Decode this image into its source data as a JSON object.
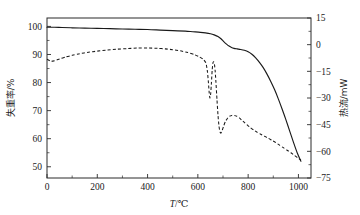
{
  "chart_data": {
    "type": "line",
    "title": "",
    "xlabel": "T/℃",
    "ylabel": "失重率/%",
    "y2label": "热流/mW",
    "xlim": [
      0,
      1050
    ],
    "ylim": [
      46,
      103
    ],
    "y2lim": [
      -75,
      15
    ],
    "grid": false,
    "legend": "none",
    "xticks": [
      0,
      200,
      400,
      600,
      800,
      1000
    ],
    "xticklabels": [
      "0",
      "200",
      "400",
      "600",
      "800",
      "1000"
    ],
    "yticks": [
      50,
      60,
      70,
      80,
      90,
      100
    ],
    "yticklabels": [
      "50",
      "60",
      "70",
      "80",
      "90",
      "100"
    ],
    "y2ticks": [
      -75,
      -60,
      -45,
      -30,
      -15,
      0,
      15
    ],
    "y2ticklabels": [
      "−75",
      "−60",
      "−45",
      "−30",
      "−15",
      "0",
      "15"
    ],
    "series": [
      {
        "name": "TG",
        "axis": "left",
        "style": "solid",
        "x": [
          0,
          30,
          60,
          100,
          150,
          200,
          250,
          300,
          350,
          400,
          450,
          500,
          550,
          580,
          610,
          630,
          650,
          665,
          680,
          692,
          703,
          714,
          724,
          734,
          744,
          756,
          770,
          785,
          800,
          815,
          830,
          845,
          860,
          875,
          890,
          905,
          920,
          935,
          950,
          965,
          980,
          995,
          1010
        ],
        "y": [
          99.7,
          99.7,
          99.6,
          99.5,
          99.4,
          99.3,
          99.2,
          99.1,
          99.0,
          98.9,
          98.7,
          98.5,
          98.3,
          98.1,
          97.9,
          97.7,
          97.4,
          97.0,
          96.4,
          95.6,
          94.6,
          93.7,
          93.0,
          92.5,
          92.2,
          92.0,
          91.8,
          91.5,
          91.0,
          90.1,
          88.8,
          87.2,
          85.3,
          83.0,
          80.4,
          77.5,
          74.2,
          70.6,
          66.8,
          62.8,
          58.8,
          55.0,
          52.0
        ]
      },
      {
        "name": "DSC",
        "axis": "left-mapped",
        "style": "dashed",
        "x": [
          0,
          15,
          30,
          50,
          75,
          100,
          130,
          165,
          200,
          240,
          280,
          320,
          360,
          400,
          440,
          470,
          500,
          530,
          560,
          585,
          605,
          620,
          632,
          638,
          642,
          645,
          648,
          651,
          654,
          657,
          660,
          663,
          666,
          669,
          672,
          676,
          680,
          684,
          688,
          692,
          697,
          703,
          710,
          718,
          726,
          735,
          745,
          755,
          765,
          775,
          785,
          795,
          808,
          822,
          836,
          850,
          865,
          880,
          895,
          910,
          925,
          940,
          955,
          970,
          985,
          1000,
          1010
        ],
        "y": [
          88.3,
          87.6,
          87.8,
          88.4,
          89.1,
          89.7,
          90.3,
          90.8,
          91.2,
          91.6,
          91.9,
          92.1,
          92.3,
          92.3,
          92.2,
          92.0,
          91.7,
          91.3,
          90.7,
          90.0,
          89.2,
          88.4,
          87.0,
          84.0,
          80.0,
          76.5,
          74.5,
          76.0,
          80.0,
          84.5,
          87.0,
          87.4,
          86.5,
          84.0,
          80.0,
          74.0,
          68.5,
          64.5,
          62.4,
          62.0,
          63.0,
          64.6,
          66.2,
          67.3,
          68.0,
          68.3,
          68.3,
          68.0,
          67.4,
          66.6,
          65.8,
          65.0,
          64.0,
          63.1,
          62.3,
          61.6,
          60.9,
          60.2,
          59.4,
          58.6,
          57.7,
          56.8,
          55.9,
          55.0,
          54.0,
          53.0,
          52.4
        ]
      }
    ]
  },
  "axes": {
    "x_title_symbol": "T",
    "x_title_unit": "/℃",
    "y_left_title": "失重率/%",
    "y_right_title": "热流/mW"
  }
}
